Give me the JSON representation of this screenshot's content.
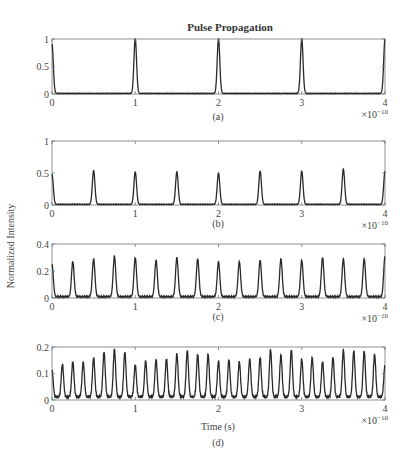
{
  "chart_data": {
    "type": "line",
    "title": "Pulse Propagation",
    "ylabel": "Normalized Intensity",
    "xlabel": "Time (s)",
    "x_exponent": "×10",
    "x_exponent_power": "−10",
    "xlim": [
      0,
      4
    ],
    "xticks": [
      "0",
      "1",
      "2",
      "3",
      "4"
    ],
    "panels": [
      {
        "caption": "(a)",
        "ylim": [
          0,
          1
        ],
        "yticks": [
          "0",
          "0.5",
          "1"
        ],
        "ytick_values": [
          0,
          0.5,
          1
        ],
        "pulse_width": 0.022,
        "baseline": 0.01,
        "peak_times": [
          0,
          1,
          2,
          3,
          4
        ],
        "peak_values": [
          0.9,
          1.0,
          1.0,
          1.0,
          1.0
        ]
      },
      {
        "caption": "(b)",
        "ylim": [
          0,
          1
        ],
        "yticks": [
          "0",
          "0.5",
          "1"
        ],
        "ytick_values": [
          0,
          0.5,
          1
        ],
        "pulse_width": 0.022,
        "baseline": 0.01,
        "peak_times": [
          0,
          0.5,
          1,
          1.5,
          2,
          2.5,
          3,
          3.5,
          4
        ],
        "peak_values": [
          0.47,
          0.53,
          0.51,
          0.51,
          0.49,
          0.52,
          0.52,
          0.55,
          0.52
        ]
      },
      {
        "caption": "(c)",
        "ylim": [
          0,
          0.4
        ],
        "yticks": [
          "0",
          "0.2",
          "0.4"
        ],
        "ytick_values": [
          0,
          0.2,
          0.4
        ],
        "pulse_width": 0.022,
        "baseline": 0.01,
        "peak_times": [
          0,
          0.25,
          0.5,
          0.75,
          1,
          1.25,
          1.5,
          1.75,
          2,
          2.25,
          2.5,
          2.75,
          3,
          3.25,
          3.5,
          3.75,
          4
        ],
        "peak_values": [
          0.24,
          0.26,
          0.28,
          0.3,
          0.29,
          0.27,
          0.29,
          0.28,
          0.26,
          0.26,
          0.27,
          0.28,
          0.27,
          0.29,
          0.28,
          0.28,
          0.3
        ]
      },
      {
        "caption": "(d)",
        "ylim": [
          0,
          0.2
        ],
        "yticks": [
          "0",
          "0.1",
          "0.2"
        ],
        "ytick_values": [
          0,
          0.1,
          0.2
        ],
        "pulse_width": 0.02,
        "baseline": 0.012,
        "peak_times": [
          0,
          0.125,
          0.25,
          0.375,
          0.5,
          0.625,
          0.75,
          0.875,
          1,
          1.125,
          1.25,
          1.375,
          1.5,
          1.625,
          1.75,
          1.875,
          2,
          2.125,
          2.25,
          2.375,
          2.5,
          2.625,
          2.75,
          2.875,
          3,
          3.125,
          3.25,
          3.375,
          3.5,
          3.625,
          3.75,
          3.875,
          4
        ],
        "peak_values": [
          0.1,
          0.123,
          0.132,
          0.131,
          0.148,
          0.169,
          0.18,
          0.169,
          0.121,
          0.136,
          0.141,
          0.143,
          0.163,
          0.174,
          0.161,
          0.161,
          0.135,
          0.14,
          0.133,
          0.143,
          0.148,
          0.178,
          0.158,
          0.177,
          0.143,
          0.148,
          0.133,
          0.148,
          0.177,
          0.173,
          0.173,
          0.16,
          0.12
        ]
      }
    ],
    "grid": false,
    "legend": null
  }
}
